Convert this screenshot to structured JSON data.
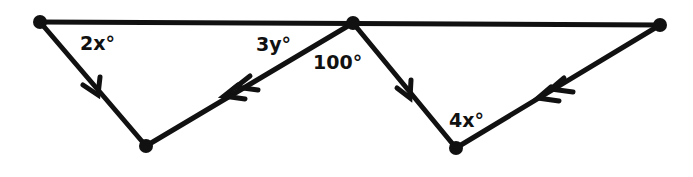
{
  "diagram": {
    "type": "geometry-parallel-lines",
    "stroke_color": "#111111",
    "background": "#ffffff",
    "points": {
      "A": [
        40,
        22
      ],
      "B": [
        353,
        23
      ],
      "C": [
        660,
        25
      ],
      "D": [
        146,
        146
      ],
      "E": [
        456,
        148
      ]
    },
    "segments": [
      {
        "from": "A",
        "to": "C",
        "arrow": "none"
      },
      {
        "from": "A",
        "to": "D",
        "arrow": "single"
      },
      {
        "from": "B",
        "to": "D",
        "arrow": "double"
      },
      {
        "from": "B",
        "to": "E",
        "arrow": "single"
      },
      {
        "from": "C",
        "to": "E",
        "arrow": "double"
      }
    ],
    "labels": [
      {
        "id": "angle-2x",
        "text": "2x°"
      },
      {
        "id": "angle-3y",
        "text": "3y°"
      },
      {
        "id": "angle-100",
        "text": "100°"
      },
      {
        "id": "angle-4x",
        "text": "4x°"
      }
    ]
  }
}
